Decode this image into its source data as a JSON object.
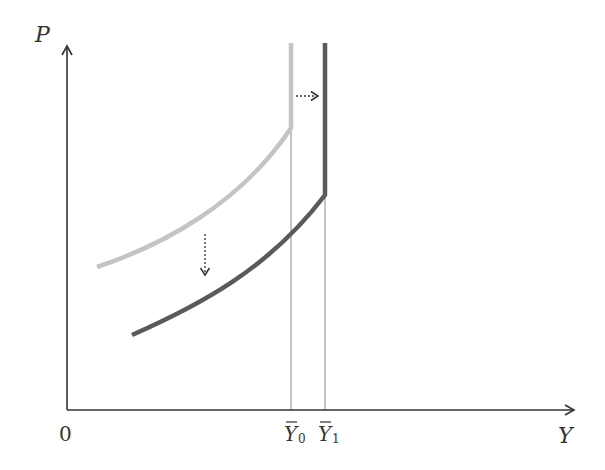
{
  "diagram": {
    "axes": {
      "y_label": "P",
      "x_label": "Y",
      "origin_label": "0"
    },
    "ticks": [
      {
        "base": "Y",
        "sub": "0",
        "bar": true
      },
      {
        "base": "Y",
        "sub": "1",
        "bar": true
      }
    ],
    "curves": [
      {
        "name": "initial-supply-curve",
        "color": "#c4c4c4",
        "vertical_at": "Y0"
      },
      {
        "name": "shifted-supply-curve",
        "color": "#5a5a5a",
        "vertical_at": "Y1"
      }
    ],
    "arrows": [
      {
        "name": "shift-right-arrow",
        "direction": "right",
        "style": "dotted"
      },
      {
        "name": "shift-down-arrow",
        "direction": "down",
        "style": "dotted"
      }
    ],
    "colors": {
      "axis": "#333333",
      "guide": "#8a8a8a",
      "light_curve": "#c4c4c4",
      "dark_curve": "#5a5a5a"
    }
  }
}
